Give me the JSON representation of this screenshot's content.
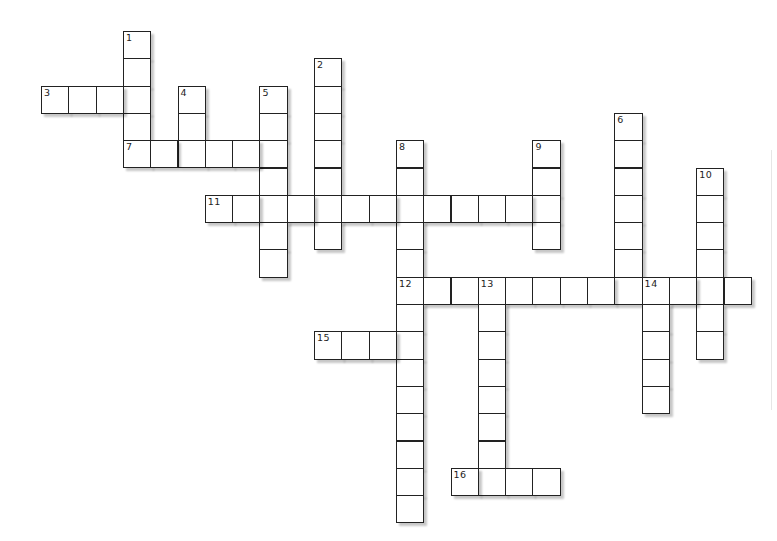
{
  "puzzle": {
    "type": "crossword",
    "grid": {
      "origin_x": 41,
      "origin_y": 31,
      "cell_size": 27.3
    },
    "colors": {
      "line": "#222222",
      "cell_fill": "#ffffff",
      "background": "#ffffff"
    },
    "entries": [
      {
        "number": "1",
        "direction": "down",
        "row": 0,
        "col": 3,
        "length": 5
      },
      {
        "number": "2",
        "direction": "down",
        "row": 1,
        "col": 10,
        "length": 7
      },
      {
        "number": "3",
        "direction": "across",
        "row": 2,
        "col": 0,
        "length": 4
      },
      {
        "number": "4",
        "direction": "down",
        "row": 2,
        "col": 5,
        "length": 3
      },
      {
        "number": "5",
        "direction": "down",
        "row": 2,
        "col": 8,
        "length": 7
      },
      {
        "number": "6",
        "direction": "down",
        "row": 3,
        "col": 21,
        "length": 7
      },
      {
        "number": "7",
        "direction": "across",
        "row": 4,
        "col": 3,
        "length": 6
      },
      {
        "number": "8",
        "direction": "down",
        "row": 4,
        "col": 13,
        "length": 14
      },
      {
        "number": "9",
        "direction": "down",
        "row": 4,
        "col": 18,
        "length": 4
      },
      {
        "number": "10",
        "direction": "down",
        "row": 5,
        "col": 24,
        "length": 7
      },
      {
        "number": "11",
        "direction": "across",
        "row": 6,
        "col": 6,
        "length": 13
      },
      {
        "number": "12",
        "direction": "across",
        "row": 9,
        "col": 13,
        "length": 13
      },
      {
        "number": "13",
        "direction": "down",
        "row": 9,
        "col": 16,
        "length": 8
      },
      {
        "number": "14",
        "direction": "down",
        "row": 9,
        "col": 22,
        "length": 5
      },
      {
        "number": "15",
        "direction": "across",
        "row": 11,
        "col": 10,
        "length": 4
      },
      {
        "number": "16",
        "direction": "across",
        "row": 16,
        "col": 15,
        "length": 4
      }
    ]
  }
}
